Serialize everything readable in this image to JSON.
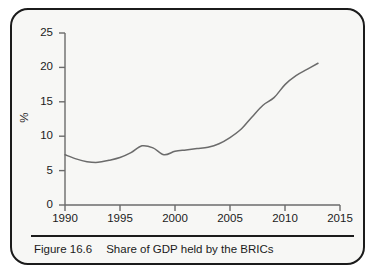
{
  "figure": {
    "caption_label": "Figure 16.6",
    "caption_text": "Share of GDP held by the BRICs",
    "border_color": "#1b1b1b",
    "background_color": "#f7f7f5"
  },
  "chart_data": {
    "type": "line",
    "title": "Share of GDP held by the BRICs",
    "xlabel": "",
    "ylabel": "%",
    "xlim": [
      1990,
      2015
    ],
    "ylim": [
      0,
      25
    ],
    "grid": false,
    "legend": "none",
    "line_color": "#6b6b6b",
    "axis_color": "#6b6b6b",
    "xticks": [
      1990,
      1995,
      2000,
      2005,
      2010,
      2015
    ],
    "yticks": [
      0,
      5,
      10,
      15,
      20,
      25
    ],
    "xtick_labels": [
      "1990",
      "1995",
      "2000",
      "2005",
      "2010",
      "2015"
    ],
    "ytick_labels": [
      "0",
      "5",
      "10",
      "15",
      "20",
      "25"
    ],
    "series": [
      {
        "name": "Share of GDP held by the BRICs",
        "x": [
          1990,
          1991,
          1992,
          1993,
          1994,
          1995,
          1996,
          1997,
          1998,
          1999,
          2000,
          2001,
          2002,
          2003,
          2004,
          2005,
          2006,
          2007,
          2008,
          2009,
          2010,
          2011,
          2012,
          2013
        ],
        "values": [
          7.3,
          6.7,
          6.3,
          6.2,
          6.5,
          6.9,
          7.6,
          8.6,
          8.3,
          7.3,
          7.8,
          8.0,
          8.2,
          8.4,
          8.9,
          9.8,
          11.0,
          12.8,
          14.5,
          15.6,
          17.5,
          18.8,
          19.7,
          20.6
        ]
      }
    ]
  }
}
